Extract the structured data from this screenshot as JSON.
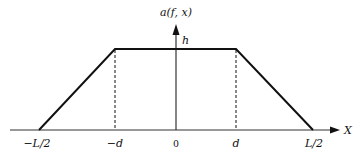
{
  "diagram": {
    "type": "trapezoid-function-plot",
    "y_axis_label": "a(f, x)",
    "x_axis_label": "X",
    "plateau_label": "h",
    "ticks": [
      {
        "label": "−L/2",
        "x": 35
      },
      {
        "label": "−d",
        "x": 115
      },
      {
        "label": "0",
        "x": 176
      },
      {
        "label": "d",
        "x": 236
      },
      {
        "label": "L/2",
        "x": 313
      }
    ],
    "shape_points": {
      "left_foot": [
        39,
        130
      ],
      "top_left": [
        115,
        49
      ],
      "top_right": [
        236,
        49
      ],
      "right_foot": [
        313,
        130
      ]
    },
    "colors": {
      "line": "#111111",
      "axis": "#333333",
      "background": "#ffffff"
    }
  }
}
